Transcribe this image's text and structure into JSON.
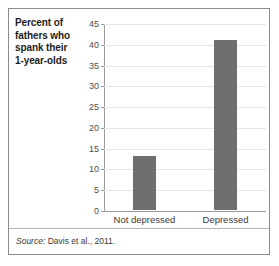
{
  "figure": {
    "y_axis_caption_lines": [
      "Percent of",
      "fathers who",
      "spank their",
      "1-year-olds"
    ],
    "source_prefix": "Source:",
    "source_text": " Davis et al., 2011."
  },
  "colors": {
    "bar": "#6f6f6f",
    "gridline": "#e6e6e6",
    "axis": "#9a9a9a",
    "frame": "#8c8c8c",
    "label_text": "#1d1d1d",
    "tick_text": "#4d4d4d"
  },
  "chart_data": {
    "type": "bar",
    "title": "",
    "subtitle": "",
    "xlabel": "",
    "ylabel": "Percent of fathers who spank their 1-year-olds",
    "categories": [
      "Not depressed",
      "Depressed"
    ],
    "values": [
      13,
      41
    ],
    "ylim": [
      0,
      45
    ],
    "yticks": [
      0,
      5,
      10,
      15,
      20,
      25,
      30,
      35,
      40,
      45
    ],
    "ytick_labels": [
      "0",
      "5",
      "10",
      "15",
      "20",
      "25",
      "30",
      "35",
      "40",
      "45"
    ],
    "grid": true,
    "grid_axis": "y",
    "legend": false,
    "legend_position": "none",
    "bar_color": "#6f6f6f",
    "source": "Source: Davis et al., 2011."
  }
}
